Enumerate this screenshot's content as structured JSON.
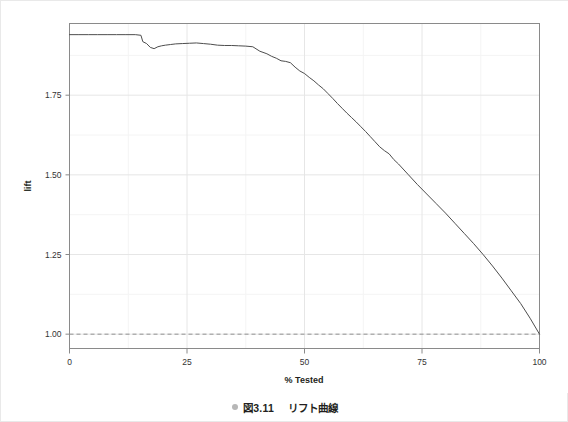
{
  "chart_data": {
    "type": "line",
    "title": "",
    "xlabel": "% Tested",
    "ylabel": "lift",
    "xlim": [
      0,
      100
    ],
    "ylim": [
      0.955,
      1.975
    ],
    "xticks": [
      0,
      25,
      50,
      75,
      100
    ],
    "xticklabels": [
      "0",
      "25",
      "50",
      "75",
      "100"
    ],
    "yticks": [
      1.0,
      1.25,
      1.5,
      1.75
    ],
    "yticklabels": [
      "1.00",
      "1.25",
      "1.50",
      "1.75"
    ],
    "grid": true,
    "grid_minor": true,
    "legend": "none",
    "series": [
      {
        "name": "lift curve",
        "style": "solid",
        "color": "#4d4d4d",
        "x": [
          0,
          2,
          4,
          6,
          8,
          10,
          12,
          14,
          15.2,
          15.6,
          16.4,
          17.2,
          18.0,
          18.8,
          19.6,
          20.4,
          21.5,
          22.6,
          24.0,
          25.5,
          27.0,
          28.5,
          30.0,
          31.5,
          33.0,
          34.5,
          36.0,
          37.5,
          39.0,
          40.5,
          42.0,
          43.0,
          44.0,
          45.0,
          46.0,
          47.0,
          48.0,
          49.0,
          50.0,
          51.0,
          52.0,
          53.0,
          54.0,
          55.0,
          56.0,
          57.0,
          58.0,
          59.0,
          60.0,
          61.0,
          62.0,
          63.0,
          64.0,
          65.0,
          66.0,
          67.0,
          68.0,
          69.0,
          70.0,
          72.0,
          74.0,
          76.0,
          78.0,
          80.0,
          82.0,
          84.0,
          86.0,
          88.0,
          90.0,
          92.0,
          94.0,
          96.0,
          98.0,
          100.0
        ],
        "y": [
          1.94,
          1.94,
          1.94,
          1.94,
          1.94,
          1.94,
          1.94,
          1.94,
          1.938,
          1.918,
          1.912,
          1.9,
          1.896,
          1.902,
          1.905,
          1.907,
          1.909,
          1.911,
          1.912,
          1.913,
          1.914,
          1.912,
          1.91,
          1.907,
          1.906,
          1.906,
          1.905,
          1.904,
          1.902,
          1.888,
          1.88,
          1.872,
          1.866,
          1.858,
          1.856,
          1.852,
          1.838,
          1.826,
          1.818,
          1.806,
          1.795,
          1.782,
          1.77,
          1.755,
          1.74,
          1.724,
          1.709,
          1.694,
          1.68,
          1.666,
          1.651,
          1.636,
          1.62,
          1.604,
          1.588,
          1.576,
          1.566,
          1.548,
          1.534,
          1.502,
          1.47,
          1.44,
          1.41,
          1.38,
          1.348,
          1.316,
          1.284,
          1.25,
          1.214,
          1.176,
          1.136,
          1.096,
          1.05,
          1.0
        ]
      },
      {
        "name": "baseline",
        "style": "dashed",
        "color": "#909090",
        "x": [
          0,
          100
        ],
        "y": [
          1.0,
          1.0
        ]
      }
    ]
  },
  "caption": {
    "bullet": "bullet-dot-icon",
    "number": "図3.11",
    "text": "リフト曲線"
  }
}
